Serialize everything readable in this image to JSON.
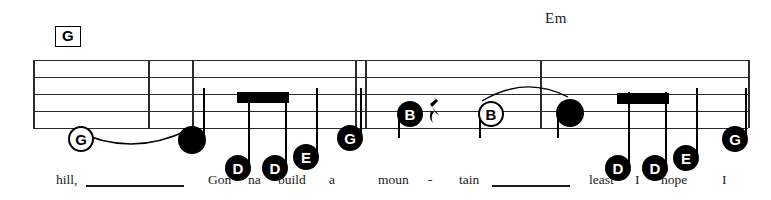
{
  "page": {
    "width": 771,
    "height": 200,
    "background": "#ffffff",
    "ink": "#000000",
    "staff_color": "#2b2b2b"
  },
  "chords": [
    {
      "name": "chord-g",
      "label": "G",
      "boxed": true,
      "x": 55,
      "y": 26
    },
    {
      "name": "chord-em",
      "label": "Em",
      "boxed": false,
      "x": 545,
      "y": 10
    }
  ],
  "staff": {
    "top": 60,
    "left": 33,
    "right": 748,
    "line_spacing": 17,
    "line_count": 5,
    "barlines": [
      33,
      148,
      192,
      355,
      365,
      540,
      748
    ]
  },
  "notes": [
    {
      "name": "note-g-open-1",
      "letter": "G",
      "type": "open",
      "x": 68,
      "y": 126,
      "size": 26,
      "font": 15,
      "stem": null
    },
    {
      "name": "note-filled-1",
      "letter": "",
      "type": "plain",
      "x": 178,
      "y": 126,
      "size": 28,
      "font": 15,
      "stem": "up"
    },
    {
      "name": "note-d-1",
      "letter": "D",
      "type": "filled",
      "x": 225,
      "y": 155,
      "size": 26,
      "font": 15,
      "stem": "up-beam"
    },
    {
      "name": "note-d-2",
      "letter": "D",
      "type": "filled",
      "x": 262,
      "y": 155,
      "size": 26,
      "font": 15,
      "stem": "up-beam"
    },
    {
      "name": "note-e-1",
      "letter": "E",
      "type": "filled",
      "x": 293,
      "y": 144,
      "size": 26,
      "font": 15,
      "stem": "up"
    },
    {
      "name": "note-g-1",
      "letter": "G",
      "type": "filled",
      "x": 337,
      "y": 125,
      "size": 26,
      "font": 15,
      "stem": "up"
    },
    {
      "name": "note-b-1",
      "letter": "B",
      "type": "filled",
      "x": 397,
      "y": 101,
      "size": 26,
      "font": 15,
      "stem": "down"
    },
    {
      "name": "note-b-open-1",
      "letter": "B",
      "type": "open",
      "x": 478,
      "y": 101,
      "size": 26,
      "font": 15,
      "stem": "down"
    },
    {
      "name": "note-filled-2",
      "letter": "",
      "type": "plain",
      "x": 556,
      "y": 99,
      "size": 28,
      "font": 15,
      "stem": "down"
    },
    {
      "name": "note-d-3",
      "letter": "D",
      "type": "filled",
      "x": 605,
      "y": 155,
      "size": 26,
      "font": 15,
      "stem": "up-beam"
    },
    {
      "name": "note-d-4",
      "letter": "D",
      "type": "filled",
      "x": 642,
      "y": 155,
      "size": 26,
      "font": 15,
      "stem": "up-beam"
    },
    {
      "name": "note-e-2",
      "letter": "E",
      "type": "filled",
      "x": 673,
      "y": 145,
      "size": 26,
      "font": 15,
      "stem": "up"
    },
    {
      "name": "note-g-2",
      "letter": "G",
      "type": "filled",
      "x": 722,
      "y": 126,
      "size": 26,
      "font": 15,
      "stem": "up"
    }
  ],
  "beams": [
    {
      "name": "beam-1",
      "x": 237,
      "y": 92,
      "width": 52,
      "height": 11
    },
    {
      "name": "beam-2",
      "x": 617,
      "y": 93,
      "width": 52,
      "height": 11
    }
  ],
  "rests": [
    {
      "name": "quarter-rest",
      "glyph": "♩",
      "x": 428,
      "y": 92,
      "label": "quarter-rest"
    }
  ],
  "slurs": [
    {
      "name": "slur-1",
      "x": 72,
      "y": 128,
      "width": 118,
      "height": 30,
      "direction": "down"
    },
    {
      "name": "slur-2",
      "x": 480,
      "y": 77,
      "width": 90,
      "height": 26,
      "direction": "up"
    }
  ],
  "lyrics": [
    {
      "name": "lyric-hill",
      "text": "hill,",
      "x": 56,
      "ext": {
        "x": 86,
        "width": 98
      }
    },
    {
      "name": "lyric-gon",
      "text": "Gon -",
      "x": 208,
      "ext": null
    },
    {
      "name": "lyric-na",
      "text": "na",
      "x": 248,
      "ext": null
    },
    {
      "name": "lyric-build",
      "text": "build",
      "x": 278,
      "ext": null
    },
    {
      "name": "lyric-a",
      "text": "a",
      "x": 329,
      "ext": null
    },
    {
      "name": "lyric-moun",
      "text": "moun",
      "x": 378,
      "ext": null
    },
    {
      "name": "lyric-hyph",
      "text": "-",
      "x": 428,
      "ext": null
    },
    {
      "name": "lyric-tain",
      "text": "tain",
      "x": 459,
      "ext": {
        "x": 492,
        "width": 78
      }
    },
    {
      "name": "lyric-least",
      "text": "least",
      "x": 589,
      "ext": null
    },
    {
      "name": "lyric-i-1",
      "text": "I",
      "x": 635,
      "ext": null
    },
    {
      "name": "lyric-hope",
      "text": "hope",
      "x": 661,
      "ext": null
    },
    {
      "name": "lyric-i-2",
      "text": "I",
      "x": 722,
      "ext": null
    }
  ],
  "lyrics_full_line": "hill,____ Gon - na build a moun - tain____ least I hope I"
}
